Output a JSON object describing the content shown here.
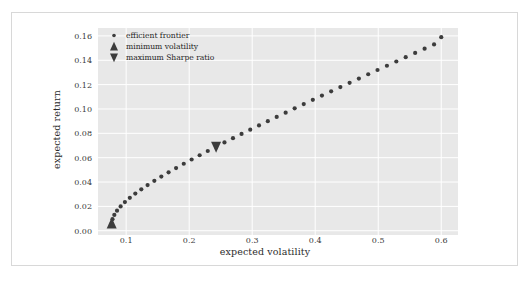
{
  "figure": {
    "background_color": "#ffffff",
    "frame_color": "#d8d8d8",
    "plot_background_color": "#e8e8e8",
    "grid_color": "#ffffff",
    "marker_color": "#3c3c3c"
  },
  "chart_data": {
    "type": "scatter",
    "title": "",
    "xlabel": "expected volatility",
    "ylabel": "expected return",
    "xlim": [
      0.0553,
      0.6266
    ],
    "ylim": [
      -0.0035,
      0.1665
    ],
    "xticks": [
      "0.1",
      "0.2",
      "0.3",
      "0.4",
      "0.5",
      "0.6"
    ],
    "xtick_values": [
      0.1,
      0.2,
      0.3,
      0.4,
      0.5,
      0.6
    ],
    "yticks": [
      "0.00",
      "0.02",
      "0.04",
      "0.06",
      "0.08",
      "0.10",
      "0.12",
      "0.14",
      "0.16"
    ],
    "ytick_values": [
      0.0,
      0.02,
      0.04,
      0.06,
      0.08,
      0.1,
      0.12,
      0.14,
      0.16
    ],
    "grid": true,
    "legend_position": "upper left",
    "legend": [
      {
        "label": "efficient frontier",
        "marker": "dot"
      },
      {
        "label": "minimum volatility",
        "marker": "triangle-up"
      },
      {
        "label": "maximum Sharpe ratio",
        "marker": "triangle-down"
      }
    ],
    "series": [
      {
        "name": "efficient frontier",
        "marker": "dot",
        "x": [
          0.077,
          0.0783,
          0.0812,
          0.0855,
          0.0912,
          0.098,
          0.1058,
          0.1145,
          0.124,
          0.134,
          0.1447,
          0.1558,
          0.1673,
          0.1792,
          0.1914,
          0.2039,
          0.2166,
          0.2295,
          0.2427,
          0.256,
          0.2695,
          0.2831,
          0.2969,
          0.3108,
          0.3248,
          0.3389,
          0.3531,
          0.3674,
          0.3818,
          0.3962,
          0.4107,
          0.4253,
          0.4399,
          0.4546,
          0.4693,
          0.4841,
          0.4989,
          0.5138,
          0.5287,
          0.5436,
          0.5586,
          0.5736,
          0.5886,
          0.6
        ],
        "y": [
          0.006,
          0.0095,
          0.013,
          0.0165,
          0.02,
          0.0235,
          0.027,
          0.0305,
          0.034,
          0.0375,
          0.041,
          0.0445,
          0.048,
          0.0515,
          0.055,
          0.0585,
          0.062,
          0.0655,
          0.069,
          0.0725,
          0.076,
          0.0795,
          0.083,
          0.0865,
          0.09,
          0.0935,
          0.097,
          0.1005,
          0.104,
          0.1075,
          0.111,
          0.1145,
          0.118,
          0.1215,
          0.125,
          0.1285,
          0.132,
          0.1355,
          0.139,
          0.1425,
          0.146,
          0.1495,
          0.153,
          0.159
        ]
      },
      {
        "name": "minimum volatility",
        "marker": "triangle-up",
        "x": [
          0.077
        ],
        "y": [
          0.006
        ]
      },
      {
        "name": "maximum Sharpe ratio",
        "marker": "triangle-down",
        "x": [
          0.2427
        ],
        "y": [
          0.069
        ]
      }
    ]
  }
}
